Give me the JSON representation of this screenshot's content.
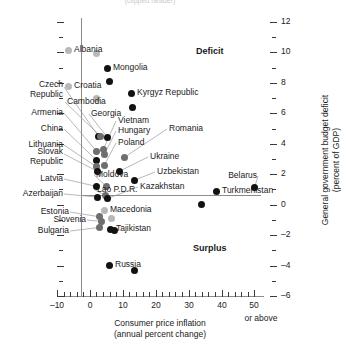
{
  "top_caption": "(clipped header)",
  "chart_data": {
    "type": "scatter",
    "title": "",
    "xlabel_line1": "Consumer price inflation",
    "xlabel_line2": "(annual percent change)",
    "ylabel_line1": "General government budget deficit",
    "ylabel_line2": "(percent of GDP)",
    "xlim": [
      -10,
      52
    ],
    "ylim": [
      -6,
      12
    ],
    "xticks": [
      -10,
      0,
      10,
      20,
      30,
      40,
      50
    ],
    "xtick_labels": [
      "-10",
      "0",
      "10",
      "20",
      "30",
      "40",
      "50"
    ],
    "x_axis_note": "or above",
    "yticks": [
      -6,
      -4,
      -2,
      0,
      2,
      4,
      6,
      8,
      10,
      12
    ],
    "ytick_labels": [
      "-6",
      "-4",
      "-2",
      "0",
      "2",
      "4",
      "6",
      "8",
      "10",
      "12"
    ],
    "y_minor_ticks": [
      -5,
      -3,
      -1,
      1,
      3,
      5,
      7,
      9,
      11
    ],
    "grid": false,
    "zero_line_y": 0,
    "zero_line_x": 0,
    "annotations": [
      {
        "text": "Deficit",
        "x": 28,
        "y": 9.9
      },
      {
        "text": "Surplus",
        "x": 28,
        "y": -2.6
      }
    ],
    "legend": [],
    "points": [
      {
        "name": "Albania",
        "x": 1.9,
        "y": 9.9,
        "shade": "light",
        "label_side": "right"
      },
      {
        "name": "Mongolia",
        "x": 6.0,
        "y": 8.1,
        "shade": "dark",
        "label_side": "right"
      },
      {
        "name": "Croatia",
        "x": 2.0,
        "y": 7.0,
        "shade": "light",
        "label_side": "right"
      },
      {
        "name": "Kyrgyz Republic",
        "x": 13.0,
        "y": 6.4,
        "shade": "dark",
        "label_side": "right"
      },
      {
        "name": "Czech Republic",
        "x": 2.6,
        "y": 4.5,
        "shade": "dark",
        "label_side": "left"
      },
      {
        "name": "Cambodia",
        "x": 3.2,
        "y": 4.5,
        "shade": "mid",
        "label_side": "above"
      },
      {
        "name": "Georgia",
        "x": 5.4,
        "y": 4.4,
        "shade": "dark",
        "label_side": "above"
      },
      {
        "name": "Armenia",
        "x": 2.1,
        "y": 3.5,
        "shade": "mid",
        "label_side": "left"
      },
      {
        "name": "Vietnam",
        "x": 4.0,
        "y": 3.6,
        "shade": "mid",
        "label_side": "right"
      },
      {
        "name": "Hungary",
        "x": 4.4,
        "y": 3.3,
        "shade": "mid",
        "label_side": "right"
      },
      {
        "name": "China",
        "x": 2.1,
        "y": 2.9,
        "shade": "dark",
        "label_side": "left"
      },
      {
        "name": "Romania",
        "x": 10.4,
        "y": 3.1,
        "shade": "mid",
        "label_side": "right"
      },
      {
        "name": "Poland",
        "x": 4.4,
        "y": 2.6,
        "shade": "mid",
        "label_side": "right"
      },
      {
        "name": "Lithuania",
        "x": 1.9,
        "y": 2.5,
        "shade": "mid",
        "label_side": "left"
      },
      {
        "name": "Slovak Republic",
        "x": 2.2,
        "y": 2.2,
        "shade": "dark",
        "label_side": "left"
      },
      {
        "name": "Ukraine",
        "x": 9.0,
        "y": 2.2,
        "shade": "dark",
        "label_side": "right"
      },
      {
        "name": "Uzbekistan",
        "x": 13.5,
        "y": 1.6,
        "shade": "dark",
        "label_side": "right"
      },
      {
        "name": "Belarus",
        "x": 50.0,
        "y": 1.1,
        "shade": "dark",
        "label_side": "left"
      },
      {
        "name": "Latvia",
        "x": 2.0,
        "y": 1.2,
        "shade": "dark",
        "label_side": "left"
      },
      {
        "name": "Moldova",
        "x": 5.0,
        "y": 1.2,
        "shade": "mid",
        "label_side": "below"
      },
      {
        "name": "Azerbaijan",
        "x": 2.3,
        "y": 0.5,
        "shade": "dark",
        "label_side": "left"
      },
      {
        "name": "Lao P.D.R.",
        "x": 4.8,
        "y": 0.6,
        "shade": "mid",
        "label_side": "below"
      },
      {
        "name": "Kazakhstan",
        "x": 5.3,
        "y": 0.4,
        "shade": "dark",
        "label_side": "below"
      },
      {
        "name": "Turkmenistan",
        "x": 34.0,
        "y": 0.0,
        "shade": "dark",
        "label_side": "right"
      },
      {
        "name": "Estonia",
        "x": 3.0,
        "y": -0.8,
        "shade": "mid",
        "label_side": "left"
      },
      {
        "name": "Macedonia",
        "x": 6.6,
        "y": -0.9,
        "shade": "light",
        "label_side": "right"
      },
      {
        "name": "Slovenia",
        "x": 3.6,
        "y": -1.1,
        "shade": "mid",
        "label_side": "left"
      },
      {
        "name": "Bulgaria",
        "x": 2.8,
        "y": -1.5,
        "shade": "mid",
        "label_side": "left"
      },
      {
        "name": "Tajikistan",
        "x": 7.5,
        "y": -1.7,
        "shade": "dark",
        "label_side": "right"
      },
      {
        "name": "Russia",
        "x": 13.5,
        "y": -4.3,
        "shade": "dark",
        "label_side": "right"
      }
    ]
  }
}
